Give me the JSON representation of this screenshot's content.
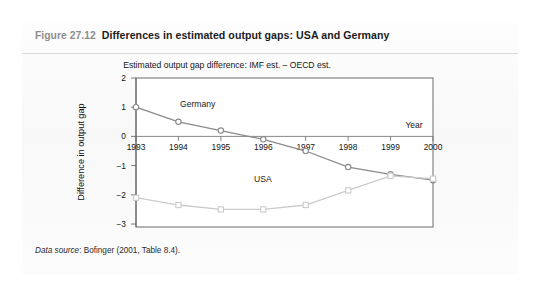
{
  "figure": {
    "number": "Figure 27.12",
    "caption": "Differences in estimated output gaps: USA and Germany",
    "source_label": "Data source",
    "source_text": ": Bofinger (2001, Table 8.4)."
  },
  "chart_data": {
    "type": "line",
    "title": "Estimated output gap difference: IMF est. – OECD est.",
    "xlabel": "Year",
    "ylabel": "Difference in output gap",
    "categories": [
      "1993",
      "1994",
      "1995",
      "1996",
      "1997",
      "1998",
      "1999",
      "2000"
    ],
    "x": [
      1993,
      1994,
      1995,
      1996,
      1997,
      1998,
      1999,
      2000
    ],
    "xlim": [
      1993,
      2000
    ],
    "ylim": [
      -3,
      2
    ],
    "yticks": [
      "2",
      "1",
      "0",
      "−1",
      "−2",
      "−3"
    ],
    "ytick_values": [
      2,
      1,
      0,
      -1,
      -2,
      -3
    ],
    "grid": false,
    "legend_position": "inline-annotations",
    "series": [
      {
        "name": "Germany",
        "color": "#8a8a8a",
        "marker": "circle",
        "values": [
          1.0,
          0.5,
          0.2,
          -0.1,
          -0.5,
          -1.05,
          -1.3,
          -1.5
        ]
      },
      {
        "name": "USA",
        "color": "#cbcbcb",
        "marker": "square",
        "values": [
          -2.1,
          -2.35,
          -2.5,
          -2.5,
          -2.35,
          -1.85,
          -1.35,
          -1.45
        ]
      }
    ],
    "annotations": [
      {
        "text": "Germany",
        "x": 1994.05,
        "y": 1.0
      },
      {
        "text": "USA",
        "x": 1996.35,
        "y": -2.18
      },
      {
        "text": "Year",
        "x": 1999.55,
        "y": 0.32
      }
    ]
  }
}
